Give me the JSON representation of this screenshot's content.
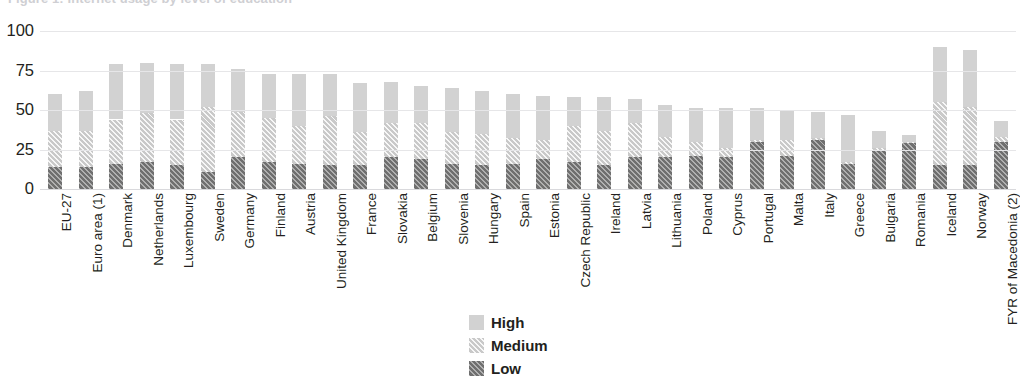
{
  "chart_data": {
    "type": "bar",
    "subtype": "stacked-column",
    "title": "",
    "xlabel": "",
    "ylabel": "",
    "ylim": [
      0,
      100
    ],
    "yticks": [
      0,
      25,
      50,
      75,
      100
    ],
    "ytick_labels": [
      "0",
      "25",
      "50",
      "75",
      "100"
    ],
    "grid": true,
    "legend_position": "bottom-center",
    "categories": [
      "EU-27",
      "Euro area (1)",
      "Denmark",
      "Netherlands",
      "Luxembourg",
      "Sweden",
      "Germany",
      "Finland",
      "Austria",
      "United Kingdom",
      "France",
      "Slovakia",
      "Belgium",
      "Slovenia",
      "Hungary",
      "Spain",
      "Estonia",
      "Czech Republic",
      "Ireland",
      "Latvia",
      "Lithuania",
      "Poland",
      "Cyprus",
      "Portugal",
      "Malta",
      "Italy",
      "Greece",
      "Bulgaria",
      "Romania",
      "Iceland",
      "Norway",
      "FYR of Macedonia (2)"
    ],
    "series": [
      {
        "name": "Low",
        "color": "#6f6f6f",
        "pattern": "diagonal-hatch-dark",
        "values": [
          14,
          14,
          16,
          17,
          15,
          11,
          20,
          17,
          16,
          15,
          15,
          20,
          19,
          16,
          15,
          16,
          19,
          17,
          15,
          20,
          20,
          21,
          20,
          30,
          21,
          31,
          16,
          25,
          29,
          15,
          15,
          30
        ]
      },
      {
        "name": "Medium",
        "color": "#c9c9c9",
        "pattern": "diagonal-hatch-light",
        "values": [
          23,
          23,
          28,
          31,
          29,
          41,
          29,
          28,
          24,
          31,
          21,
          22,
          23,
          20,
          20,
          16,
          12,
          23,
          22,
          22,
          13,
          9,
          6,
          1,
          10,
          1,
          1,
          1,
          1,
          40,
          37,
          3
        ]
      },
      {
        "name": "High",
        "color": "#d2d2d2",
        "pattern": "solid",
        "values": [
          23,
          25,
          35,
          32,
          35,
          27,
          27,
          28,
          33,
          27,
          31,
          26,
          23,
          28,
          27,
          28,
          28,
          18,
          21,
          15,
          20,
          21,
          25,
          20,
          19,
          17,
          30,
          11,
          4,
          35,
          36,
          10
        ]
      }
    ],
    "totals": [
      60,
      62,
      79,
      80,
      79,
      79,
      76,
      73,
      73,
      73,
      67,
      68,
      65,
      64,
      62,
      60,
      59,
      58,
      58,
      57,
      53,
      51,
      51,
      51,
      50,
      49,
      47,
      37,
      34,
      90,
      88,
      43
    ]
  },
  "legend": {
    "items": [
      {
        "label": "High",
        "key": "sw-high"
      },
      {
        "label": "Medium",
        "key": "sw-med"
      },
      {
        "label": "Low",
        "key": "sw-low"
      }
    ]
  },
  "title_sliver": "Figure 1: Internet usage by level of education"
}
